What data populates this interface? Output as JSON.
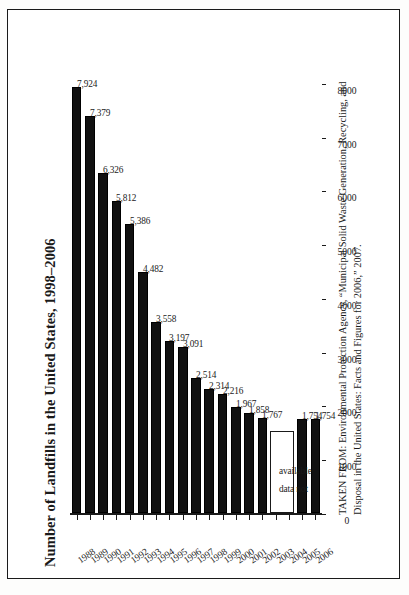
{
  "figure": {
    "title": "Number of Landfills in the United States, 1998–2006",
    "source_caption": "TAKEN FROM: Environmental Protection Agency, “Municipal Solid Waste Generation, Recycling, and Disposal in the United States: Facts and Figures for 2006,” 2007.",
    "no_data_text_line1": "data not",
    "no_data_text_line2": "available",
    "accent_color": "#111111",
    "frame_color": "#1a1a1a"
  },
  "chart_data": {
    "type": "bar",
    "orientation": "horizontal",
    "title": "Number of Landfills in the United States, 1998–2006",
    "xlabel": "",
    "ylabel": "",
    "xlim": [
      0,
      8000
    ],
    "grid": false,
    "legend": false,
    "tick_labels": [
      "8000",
      "7000",
      "6000",
      "5000",
      "4000",
      "3000",
      "2000",
      "1000",
      "0"
    ],
    "ticks": [
      8000,
      7000,
      6000,
      5000,
      4000,
      3000,
      2000,
      1000,
      0
    ],
    "categories": [
      "1988",
      "1989",
      "1990",
      "1991",
      "1992",
      "1993",
      "1994",
      "1995",
      "1996",
      "1997",
      "1998",
      "1999",
      "2000",
      "2001",
      "2002",
      "2003",
      "2004",
      "2005",
      "2006"
    ],
    "values": [
      7924,
      7379,
      6326,
      5812,
      5386,
      4482,
      3558,
      3197,
      3091,
      2514,
      2314,
      2216,
      1967,
      1858,
      1767,
      null,
      null,
      1754,
      1754
    ],
    "value_labels": [
      "7,924",
      "7,379",
      "6,326",
      "5,812",
      "5,386",
      "4,482",
      "3,558",
      "3,197",
      "3,091",
      "2,514",
      "2,314",
      "2,216",
      "1,967",
      "1,858",
      "1,767",
      "",
      "",
      "1,754",
      "1,754"
    ],
    "missing_note": "data not available"
  }
}
